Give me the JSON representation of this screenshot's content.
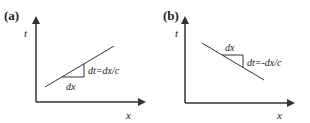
{
  "panels": [
    {
      "label": "(a)",
      "y_axis_label": "t",
      "x_axis_label": "x",
      "base_label": "dx",
      "slope_label": "dt=dx/c",
      "slope": "positive"
    },
    {
      "label": "(b)",
      "y_axis_label": "t",
      "x_axis_label": "x",
      "base_label": "dx",
      "slope_label": "dt=-dx/c",
      "slope": "negative"
    }
  ],
  "colors": {
    "line": "#333333",
    "text": "#222222",
    "background": "#ffffff"
  }
}
